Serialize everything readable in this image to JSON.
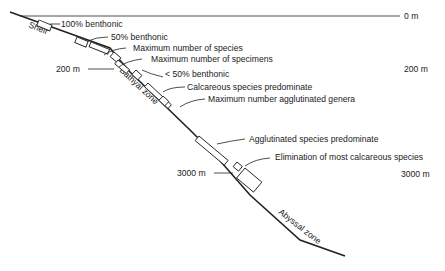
{
  "diagram": {
    "depths": {
      "surface": "0 m",
      "shelf_break_left": "200 m",
      "shelf_break_right": "200 m",
      "deep_left": "3000 m",
      "deep_right": "3000 m"
    },
    "zones": {
      "shelf": "Shelf",
      "bathyal": "Bathyal zone",
      "abyssal": "Abyssal zone"
    },
    "annotations": [
      "100% benthonic",
      "50% benthonic",
      "Maximum number of species",
      "Maximum number of specimens",
      "< 50% benthonic",
      "Calcareous species predominate",
      "Maximum number agglutinated genera",
      "Agglutinated species predominate",
      "Elimination of most calcareous species"
    ],
    "colors": {
      "ink": "#222222",
      "background": "#ffffff"
    }
  }
}
